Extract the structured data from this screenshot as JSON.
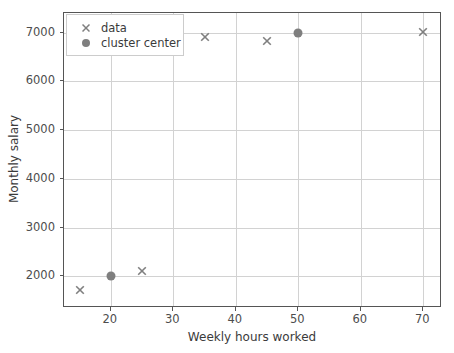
{
  "chart_data": {
    "type": "scatter",
    "title": "",
    "xlabel": "Weekly hours worked",
    "ylabel": "Monthly salary",
    "xlim": [
      12.5,
      73
    ],
    "ylim": [
      1350,
      7400
    ],
    "xticks": [
      20,
      30,
      40,
      50,
      60,
      70
    ],
    "yticks": [
      2000,
      3000,
      4000,
      5000,
      6000,
      7000
    ],
    "grid": true,
    "legend_position": "upper left",
    "series": [
      {
        "name": "data",
        "marker": "x",
        "color": "#7f7f7f",
        "points": [
          {
            "x": 15,
            "y": 1800
          },
          {
            "x": 25,
            "y": 2200
          },
          {
            "x": 35,
            "y": 7000
          },
          {
            "x": 45,
            "y": 6900
          },
          {
            "x": 70,
            "y": 7100
          }
        ]
      },
      {
        "name": "cluster center",
        "marker": "o",
        "color": "#7f7f7f",
        "points": [
          {
            "x": 20,
            "y": 2000
          },
          {
            "x": 50,
            "y": 7000
          }
        ]
      }
    ],
    "legend": [
      {
        "label": "data",
        "marker": "x"
      },
      {
        "label": "cluster center",
        "marker": "o"
      }
    ]
  },
  "colors": {
    "marker": "#7f7f7f",
    "grid": "#d2d2d2",
    "spine": "#555555",
    "text": "#3b3b3b",
    "tick_text": "#4d4d4d",
    "background": "#ffffff",
    "legend_border": "#cccccc"
  }
}
